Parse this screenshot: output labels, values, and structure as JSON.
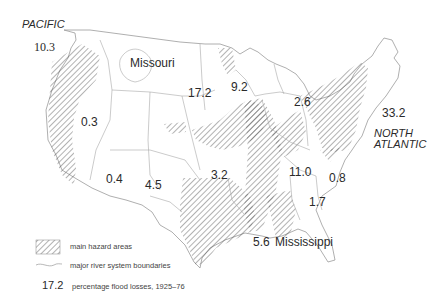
{
  "map": {
    "type": "thematic choropleth-style map of the contiguous United States",
    "oceans": {
      "pacific": "PACIFIC",
      "north_atlantic_line1": "NORTH",
      "north_atlantic_line2": "ATLANTIC"
    },
    "regions": [
      {
        "name": "Pacific",
        "value": "10.3"
      },
      {
        "name": "Missouri",
        "label": "Missouri",
        "value": "17.2"
      },
      {
        "name": "Upper Mississippi",
        "value": "9.2"
      },
      {
        "name": "Great Lakes",
        "value": "2.6"
      },
      {
        "name": "North Atlantic",
        "value": "33.2"
      },
      {
        "name": "Great Basin",
        "value": "0.3"
      },
      {
        "name": "Colorado",
        "value": "0.4"
      },
      {
        "name": "Rio Grande",
        "value": "4.5"
      },
      {
        "name": "Arkansas-Red-White",
        "value": "3.2"
      },
      {
        "name": "Ohio",
        "value": "11.0"
      },
      {
        "name": "South Atlantic",
        "value": "0.8"
      },
      {
        "name": "Southeast",
        "value": "1.7"
      },
      {
        "name": "Lower Mississippi",
        "label": "Mississippi",
        "value": "5.6"
      }
    ],
    "labels": {
      "missouri": "Missouri",
      "mississippi": "Mississippi",
      "v_pacific": "10.3",
      "v_missouri": "17.2",
      "v_upper_miss": "9.2",
      "v_great_lakes": "2.6",
      "v_north_atlantic": "33.2",
      "v_great_basin": "0.3",
      "v_colorado": "0.4",
      "v_rio_grande": "4.5",
      "v_arkansas": "3.2",
      "v_ohio": "11.0",
      "v_south_atlantic": "0.8",
      "v_southeast": "1.7",
      "v_lower_miss": "5.6"
    },
    "colors": {
      "outline": "#9a9a9a",
      "hatch": "#555555",
      "text": "#2a2a2a",
      "background": "#ffffff"
    }
  },
  "legend": {
    "hazard_label": "main hazard areas",
    "river_label": "major river system boundaries",
    "value_sample": "17.2",
    "value_label": "percentage flood losses, 1925–76"
  }
}
